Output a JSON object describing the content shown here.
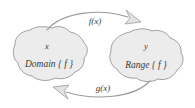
{
  "figure": {
    "type": "function-mapping-diagram",
    "background_color": "#ffffff"
  },
  "blobs": [
    {
      "id": "domain",
      "variable": "x",
      "set_label": "Domain { f }",
      "fill_color": "#ececec",
      "stroke_color": "#8a8a8a"
    },
    {
      "id": "range",
      "variable": "y",
      "set_label": "Range { f }",
      "fill_color": "#ececec",
      "stroke_color": "#8a8a8a"
    }
  ],
  "arrows": [
    {
      "id": "forward",
      "label": "f(x)",
      "direction": "domain-to-range",
      "position": "top",
      "stroke_color": "#9a9a9a"
    },
    {
      "id": "inverse",
      "label": "g(x)",
      "direction": "range-to-domain",
      "position": "bottom",
      "stroke_color": "#9a9a9a"
    }
  ]
}
